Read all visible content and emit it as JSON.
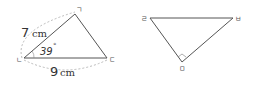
{
  "left_triangle": {
    "vertices": {
      "top": "ㄱ",
      "left": "ㄴ",
      "right": "ㄷ"
    },
    "side_left": {
      "value": "7",
      "unit": "cm"
    },
    "side_bottom": {
      "value": "9",
      "unit": "cm"
    },
    "angle": {
      "value": "39",
      "unit": "°"
    }
  },
  "right_triangle": {
    "vertices": {
      "left": "ㄹ",
      "right": "ㅂ",
      "bottom": "ㅁ"
    },
    "right_angle_at": "ㅁ"
  },
  "colors": {
    "line": "#555555",
    "dashed": "#aaaaaa"
  }
}
